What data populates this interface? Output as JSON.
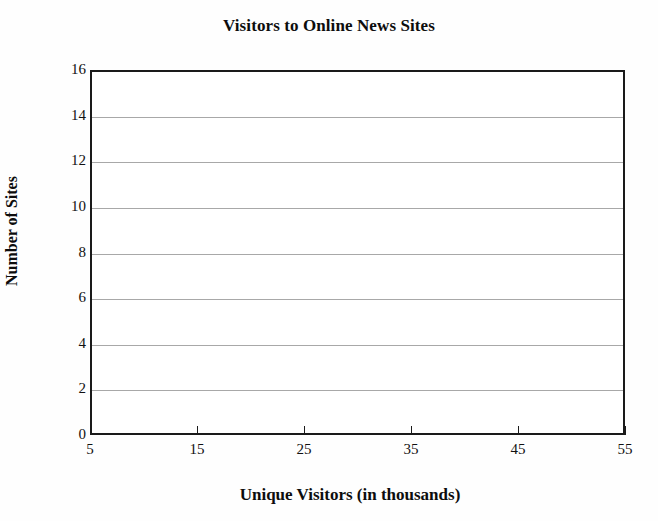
{
  "chart_data": {
    "type": "bar",
    "title": "Visitors to Online News Sites",
    "subtitle": "",
    "xlabel": "Unique Visitors (in thousands)",
    "ylabel": "Number of Sites",
    "categories": [],
    "values": [],
    "series": [],
    "xtick_labels": [
      "5",
      "15",
      "25",
      "35",
      "45",
      "55"
    ],
    "xtick_values": [
      5,
      15,
      25,
      35,
      45,
      55
    ],
    "ytick_labels": [
      "0",
      "2",
      "4",
      "6",
      "8",
      "10",
      "12",
      "14",
      "16"
    ],
    "ytick_values": [
      0,
      2,
      4,
      6,
      8,
      10,
      12,
      14,
      16
    ],
    "xlim": [
      5,
      55
    ],
    "ylim": [
      0,
      16
    ],
    "grid": "horizontal",
    "legend": "none",
    "annotations": [],
    "note": "Empty plotting region - axes template with no plotted data"
  },
  "style": {
    "background_color": "#fefefe",
    "plot_background_color": "#ffffff",
    "axis_color": "#1a1a1a",
    "gridline_color": "#a8a8a8",
    "text_color": "#111111"
  }
}
